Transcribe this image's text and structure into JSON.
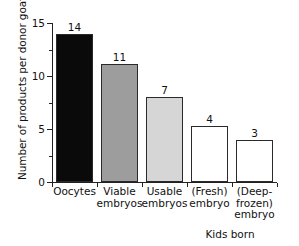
{
  "chart_data": {
    "type": "bar",
    "title": "",
    "xlabel": "",
    "ylabel": "Number of products per donor goat",
    "categories": [
      "Oocytes",
      "Viable embryos",
      "Usable embryos",
      "(Fresh) embryo",
      "(Deep-frozen) embryo"
    ],
    "category_lines": [
      [
        "Oocytes"
      ],
      [
        "Viable",
        "embryos"
      ],
      [
        "Usable",
        "embryos"
      ],
      [
        "(Fresh)",
        "embryo"
      ],
      [
        "(Deep-",
        "frozen)",
        "embryo"
      ]
    ],
    "values": [
      14,
      11,
      7,
      4,
      3
    ],
    "value_labels": [
      "14",
      "11",
      "7",
      "4",
      "3"
    ],
    "drawn_heights": [
      14,
      11.1,
      8,
      5.3,
      4
    ],
    "bar_colors": [
      "#0a0a0a",
      "#9d9d9d",
      "#d6d6d6",
      "#ffffff",
      "#ffffff"
    ],
    "bar_edge_color": "#2a2a2a",
    "ylim": [
      0,
      15
    ],
    "ytick_labels": [
      "0",
      "5",
      "10",
      "15"
    ],
    "ytick_values": [
      0,
      5,
      10,
      15
    ],
    "yminor_values": [
      2.5,
      7.5,
      12.5
    ],
    "grid": false,
    "legend": false,
    "annotations": [
      {
        "text": "Kids born",
        "covers": [
          "(Fresh) embryo",
          "(Deep-frozen) embryo"
        ]
      }
    ],
    "group_label": "Kids born"
  }
}
